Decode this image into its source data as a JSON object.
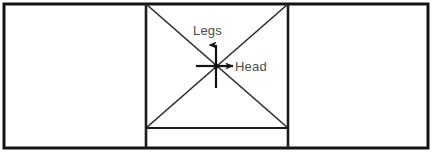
{
  "figure": {
    "background_color": "#ffffff",
    "line_color": "#141414",
    "label_color": "#4c4c4c",
    "canvas": {
      "width": 433,
      "height": 156
    },
    "outer_frame": {
      "x": 4,
      "y": 4,
      "width": 424,
      "height": 144
    },
    "dividers": {
      "left_x": 146,
      "right_x": 288
    },
    "middle_panel": {
      "x": 146,
      "y": 4,
      "width": 142,
      "height": 144
    },
    "baseline": {
      "y": 128,
      "x1": 146,
      "x2": 288
    },
    "diagonals": [
      {
        "name": "diagonal-top-left-to-bottom-right",
        "x1": 146,
        "y1": 4,
        "x2": 288,
        "y2": 128
      },
      {
        "name": "diagonal-top-right-to-bottom-left",
        "x1": 288,
        "y1": 4,
        "x2": 146,
        "y2": 128
      }
    ],
    "origin": {
      "x": 216,
      "y": 66
    },
    "axes": [
      {
        "id": "legs-axis",
        "label": "Legs",
        "direction": "up",
        "arrow": true,
        "label_x": 193,
        "label_y": 35
      },
      {
        "id": "head-axis",
        "label": "Head",
        "direction": "right",
        "arrow": true,
        "label_x": 235,
        "label_y": 71
      }
    ],
    "crosshair": {
      "arm_length": 22,
      "has_center_dot": true,
      "arms": [
        "up",
        "down",
        "left",
        "right"
      ]
    }
  }
}
